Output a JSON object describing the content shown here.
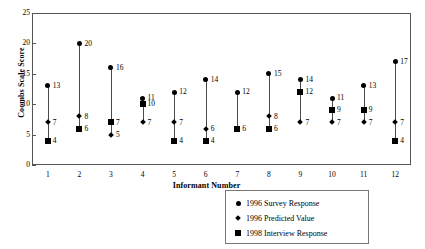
{
  "chart_data": {
    "type": "scatter",
    "title": "",
    "xlabel": "Informant Number",
    "ylabel": "Coombs Scale Score",
    "xlim": [
      0.5,
      12.5
    ],
    "ylim": [
      0,
      25
    ],
    "yticks": [
      0,
      5,
      10,
      15,
      20,
      25
    ],
    "grid": false,
    "legend_position": "bottom-right",
    "categories": [
      "1",
      "2",
      "3",
      "4",
      "5",
      "6",
      "7",
      "8",
      "9",
      "10",
      "11",
      "12"
    ],
    "series": [
      {
        "name": "1996 Survey Response",
        "marker": "circle",
        "values": [
          13,
          20,
          16,
          11,
          12,
          14,
          12,
          15,
          14,
          11,
          13,
          17
        ]
      },
      {
        "name": "1996 Predicted Value",
        "marker": "diamond",
        "values": [
          7,
          8,
          5,
          7,
          7,
          6,
          6,
          8,
          7,
          7,
          7,
          7
        ]
      },
      {
        "name": "1998 Interview Response",
        "marker": "square",
        "values": [
          4,
          6,
          7,
          10,
          4,
          4,
          6,
          6,
          12,
          9,
          9,
          4
        ]
      }
    ],
    "point_labels": {
      "1": [
        "13",
        "7",
        "4"
      ],
      "2": [
        "20",
        "8",
        "6"
      ],
      "3": [
        "16",
        "5",
        "7"
      ],
      "4": [
        "11",
        "7",
        "10"
      ],
      "5": [
        "12",
        "7",
        "4"
      ],
      "6": [
        "14",
        "6",
        "4"
      ],
      "7": [
        "12",
        "6",
        "6"
      ],
      "8": [
        "15",
        "8",
        "6"
      ],
      "9": [
        "14",
        "7",
        "12"
      ],
      "10": [
        "11",
        "7",
        "9"
      ],
      "11": [
        "13",
        "7",
        "9"
      ],
      "12": [
        "17",
        "7",
        "4"
      ]
    },
    "legend": [
      {
        "marker": "circle",
        "label": "1996 Survey Response"
      },
      {
        "marker": "diamond",
        "label": "1996 Predicted Value"
      },
      {
        "marker": "square",
        "label": "1998 Interview Response"
      }
    ],
    "colors": {
      "marker": "#000000",
      "stem": "#4a4a4a",
      "frame": "#555555"
    }
  }
}
